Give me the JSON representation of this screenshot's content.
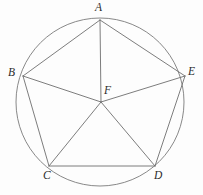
{
  "figure": {
    "kind": "geometry-diagram",
    "background_color": "#fdfdfd",
    "stroke_color": "#6e6e6e",
    "label_color": "#2b2b2b",
    "canvas": {
      "width": 203,
      "height": 195
    },
    "circle": {
      "cx": 100,
      "cy": 102,
      "r": 84
    },
    "points": [
      {
        "id": "A",
        "label": "A",
        "x": 100,
        "y": 20,
        "label_x": 95,
        "label_y": 2,
        "role": "pentagon-vertex"
      },
      {
        "id": "B",
        "label": "B",
        "x": 23,
        "y": 76,
        "label_x": 8,
        "label_y": 67,
        "role": "pentagon-vertex"
      },
      {
        "id": "C",
        "label": "C",
        "x": 49,
        "y": 166,
        "label_x": 43,
        "label_y": 170,
        "role": "pentagon-vertex"
      },
      {
        "id": "D",
        "label": "D",
        "x": 155,
        "y": 166,
        "label_x": 154,
        "label_y": 170,
        "role": "pentagon-vertex"
      },
      {
        "id": "E",
        "label": "E",
        "x": 185,
        "y": 76,
        "label_x": 188,
        "label_y": 66,
        "role": "pentagon-vertex"
      },
      {
        "id": "F",
        "label": "F",
        "x": 101,
        "y": 102,
        "label_x": 104,
        "label_y": 85,
        "role": "center"
      }
    ],
    "segments": [
      {
        "from": "A",
        "to": "B",
        "kind": "pentagon-side"
      },
      {
        "from": "B",
        "to": "C",
        "kind": "pentagon-side"
      },
      {
        "from": "C",
        "to": "D",
        "kind": "pentagon-side"
      },
      {
        "from": "D",
        "to": "E",
        "kind": "pentagon-side"
      },
      {
        "from": "E",
        "to": "A",
        "kind": "pentagon-side"
      },
      {
        "from": "F",
        "to": "A",
        "kind": "radius"
      },
      {
        "from": "F",
        "to": "B",
        "kind": "radius"
      },
      {
        "from": "F",
        "to": "C",
        "kind": "radius"
      },
      {
        "from": "F",
        "to": "D",
        "kind": "radius"
      },
      {
        "from": "F",
        "to": "E",
        "kind": "radius"
      }
    ]
  }
}
